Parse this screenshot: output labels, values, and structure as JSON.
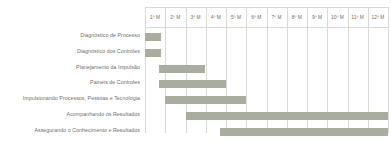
{
  "chart_data": {
    "type": "bar",
    "subtype": "gantt",
    "title": "",
    "xlabel": "",
    "ylabel": "",
    "orientation": "horizontal",
    "grid": true,
    "legend": "none",
    "bar_color": "#a8ada0",
    "grid_color": "#d9dad4",
    "text_color": "#6f6f6a",
    "background": "#ffffff",
    "xlim": [
      0,
      12
    ],
    "x_unit": "month",
    "categories": [
      "1º M",
      "2º M",
      "3º M",
      "4º M",
      "5º M",
      "6º M",
      "7º M",
      "8º M",
      "9º M",
      "10º M",
      "11º M",
      "12º M"
    ],
    "tasks": [
      {
        "label": "Diagnóstico de Processo",
        "start": 0.0,
        "end": 0.78,
        "duration": 0.78
      },
      {
        "label": "Diagnóstico dos Controles",
        "start": 0.0,
        "end": 0.78,
        "duration": 0.78
      },
      {
        "label": "Planejamento da Impulsão",
        "start": 0.7,
        "end": 2.95,
        "duration": 2.25
      },
      {
        "label": "Painéis de Controles",
        "start": 0.7,
        "end": 4.0,
        "duration": 3.3
      },
      {
        "label": "Impulsionando Processos, Pessoas e Tecnologia",
        "start": 1.0,
        "end": 5.0,
        "duration": 4.0
      },
      {
        "label": "Acompanhando os Resultados",
        "start": 2.0,
        "end": 12.0,
        "duration": 10.0
      },
      {
        "label": "Assegurando o Conhecimento e Resultados",
        "start": 3.7,
        "end": 12.0,
        "duration": 8.3
      }
    ]
  }
}
